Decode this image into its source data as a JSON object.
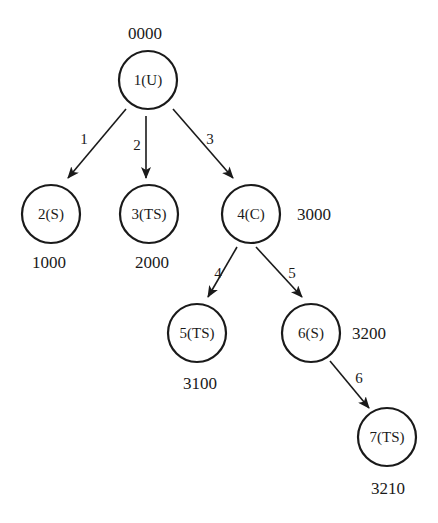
{
  "diagram": {
    "type": "tree",
    "colors": {
      "ink": "#1a1a1a",
      "background": "#ffffff"
    },
    "nodes": [
      {
        "id": "1",
        "label": "1(U)",
        "code": "0000",
        "cx": 148,
        "cy": 80,
        "r": 29,
        "code_x": 145,
        "code_y": 39
      },
      {
        "id": "2",
        "label": "2(S)",
        "code": "1000",
        "cx": 51,
        "cy": 214,
        "r": 29,
        "code_x": 49,
        "code_y": 268
      },
      {
        "id": "3",
        "label": "3(TS)",
        "code": "2000",
        "cx": 149,
        "cy": 214,
        "r": 29,
        "code_x": 152,
        "code_y": 268
      },
      {
        "id": "4",
        "label": "4(C)",
        "code": "3000",
        "cx": 251,
        "cy": 214,
        "r": 29,
        "code_x": 314,
        "code_y": 220
      },
      {
        "id": "5",
        "label": "5(TS)",
        "code": "3100",
        "cx": 197,
        "cy": 333,
        "r": 29,
        "code_x": 200,
        "code_y": 389
      },
      {
        "id": "6",
        "label": "6(S)",
        "code": "3200",
        "cx": 311,
        "cy": 333,
        "r": 29,
        "code_x": 369,
        "code_y": 339
      },
      {
        "id": "7",
        "label": "7(TS)",
        "code": "3210",
        "cx": 387,
        "cy": 437,
        "r": 29,
        "code_x": 388,
        "code_y": 494
      }
    ],
    "edges": [
      {
        "from": "1",
        "to": "2",
        "label": "1",
        "x1": 126,
        "y1": 109,
        "x2": 68,
        "y2": 178,
        "lx": 84,
        "ly": 144
      },
      {
        "from": "1",
        "to": "3",
        "label": "2",
        "x1": 146,
        "y1": 116,
        "x2": 146,
        "y2": 178,
        "lx": 137,
        "ly": 150
      },
      {
        "from": "1",
        "to": "4",
        "label": "3",
        "x1": 173,
        "y1": 109,
        "x2": 233,
        "y2": 178,
        "lx": 210,
        "ly": 144
      },
      {
        "from": "4",
        "to": "5",
        "label": "4",
        "x1": 237,
        "y1": 247,
        "x2": 208,
        "y2": 297,
        "lx": 218,
        "ly": 278
      },
      {
        "from": "4",
        "to": "6",
        "label": "5",
        "x1": 256,
        "y1": 247,
        "x2": 302,
        "y2": 297,
        "lx": 292,
        "ly": 278
      },
      {
        "from": "6",
        "to": "7",
        "label": "6",
        "x1": 330,
        "y1": 361,
        "x2": 369,
        "y2": 408,
        "lx": 359,
        "ly": 383
      }
    ]
  }
}
